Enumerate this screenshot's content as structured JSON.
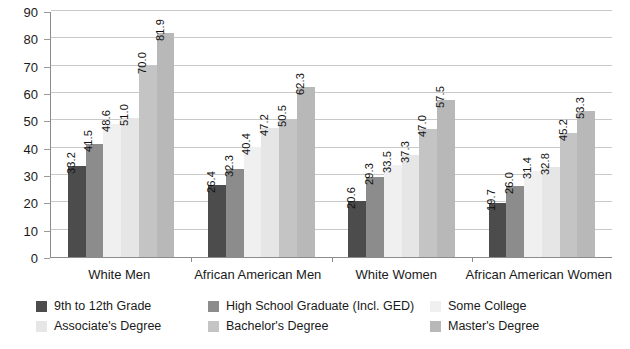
{
  "chart_data": {
    "type": "bar",
    "title": "",
    "subtitle": "",
    "xlabel": "",
    "ylabel": "",
    "ylim": [
      0,
      90
    ],
    "ytick_step": 10,
    "yticks": [
      "0",
      "10",
      "20",
      "30",
      "40",
      "50",
      "60",
      "70",
      "80",
      "90"
    ],
    "grid": true,
    "grid_axis": "y",
    "legend_position": "bottom",
    "orientation": "vertical",
    "value_labels": true,
    "value_label_rotation": -90,
    "categories": [
      "White Men",
      "African American Men",
      "White Women",
      "African American Women"
    ],
    "series": [
      {
        "name": "9th to 12th Grade",
        "color": "#4c4c4c",
        "values": [
          33.2,
          26.4,
          20.6,
          19.7
        ],
        "labels": [
          "33.2",
          "26.4",
          "20.6",
          "19.7"
        ]
      },
      {
        "name": "High School Graduate (Incl. GED)",
        "color": "#8c8c8c",
        "values": [
          41.5,
          32.3,
          29.3,
          26.0
        ],
        "labels": [
          "41.5",
          "32.3",
          "29.3",
          "26.0"
        ]
      },
      {
        "name": "Some College",
        "color": "#f0f0f0",
        "values": [
          48.6,
          40.4,
          33.5,
          31.4
        ],
        "labels": [
          "48.6",
          "40.4",
          "33.5",
          "31.4"
        ]
      },
      {
        "name": "Associate's Degree",
        "color": "#e6e6e6",
        "values": [
          51.0,
          47.2,
          37.3,
          32.8
        ],
        "labels": [
          "51.0",
          "47.2",
          "37.3",
          "32.8"
        ]
      },
      {
        "name": "Bachelor's Degree",
        "color": "#c4c4c4",
        "values": [
          70.0,
          50.5,
          47.0,
          45.2
        ],
        "labels": [
          "70.0",
          "50.5",
          "47.0",
          "45.2"
        ]
      },
      {
        "name": "Master's Degree",
        "color": "#b8b8b8",
        "values": [
          81.9,
          62.3,
          57.5,
          53.3
        ],
        "labels": [
          "81.9",
          "62.3",
          "57.5",
          "53.3"
        ]
      }
    ]
  },
  "legend": {
    "rows": [
      [
        {
          "label": "9th to 12th Grade",
          "color": "#4c4c4c",
          "width": 172
        },
        {
          "label": "High School Graduate (Incl. GED)",
          "color": "#8c8c8c",
          "width": 222
        },
        {
          "label": "Some College",
          "color": "#f0f0f0",
          "width": 130
        }
      ],
      [
        {
          "label": "Associate's Degree",
          "color": "#e6e6e6",
          "width": 172
        },
        {
          "label": "Bachelor's Degree",
          "color": "#c4c4c4",
          "width": 222
        },
        {
          "label": "Master's Degree",
          "color": "#b8b8b8",
          "width": 130
        }
      ]
    ]
  },
  "colors": {
    "axis": "#8c8c8c",
    "gridline": "#c9c9c9",
    "text": "#1a1a1a",
    "background": "#ffffff"
  }
}
